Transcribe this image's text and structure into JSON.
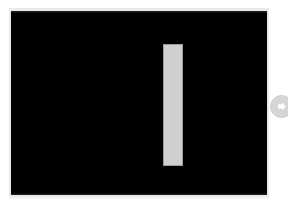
{
  "viewer": {
    "name": "image-viewer",
    "background_color": "#ffffff",
    "canvas": {
      "name": "image-canvas",
      "background_color": "#000000",
      "frame_color": "#e9e9e9",
      "alt_text": "Black background with a single light gray vertical bar",
      "width_px": "256",
      "height_px": "184"
    },
    "subject": {
      "name": "vertical-bar",
      "fill_color": "#cfcfcf",
      "outline_color": "#9b9b9b",
      "label": "",
      "width_px": "20",
      "height_px": "122"
    },
    "controls": {
      "next": {
        "label": "",
        "aria_label": "Next",
        "icon": "arrow-right-circle-icon",
        "circle_color": "#d6d6d6",
        "arrow_color": "#ffffff"
      }
    }
  }
}
